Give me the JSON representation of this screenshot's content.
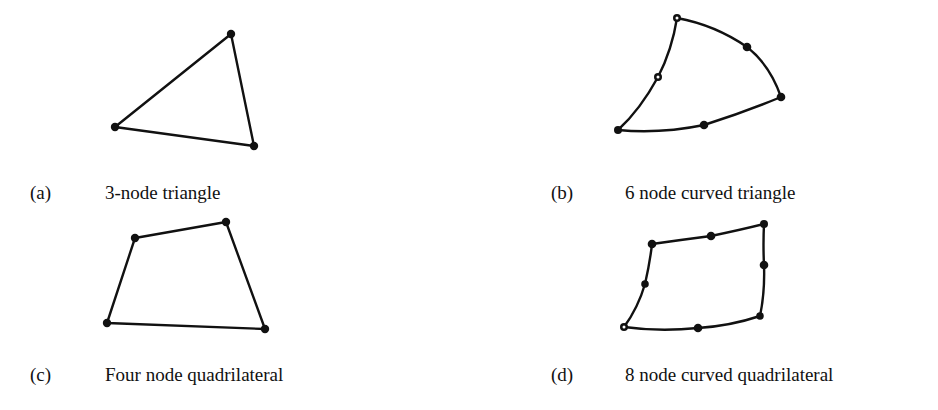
{
  "figure": {
    "panels": [
      {
        "id": "(a)",
        "caption": "3-node triangle",
        "element_type": "triangle",
        "node_count": 3,
        "curved": false,
        "corner_nodes": [
          [
            231,
            34
          ],
          [
            115,
            127
          ],
          [
            254,
            146
          ]
        ],
        "mid_nodes": []
      },
      {
        "id": "(b)",
        "caption": "6 node curved triangle",
        "element_type": "triangle",
        "node_count": 6,
        "curved": true,
        "corner_nodes": [
          [
            677,
            18
          ],
          [
            618,
            130
          ],
          [
            781,
            97
          ]
        ],
        "mid_nodes": [
          [
            658,
            77
          ],
          [
            704,
            125
          ],
          [
            747,
            47
          ]
        ]
      },
      {
        "id": "(c)",
        "caption": "Four node quadrilateral",
        "element_type": "quadrilateral",
        "node_count": 4,
        "curved": false,
        "corner_nodes": [
          [
            135,
            238
          ],
          [
            226,
            222
          ],
          [
            265,
            329
          ],
          [
            107,
            323
          ]
        ],
        "mid_nodes": []
      },
      {
        "id": "(d)",
        "caption": "8 node curved quadrilateral",
        "element_type": "quadrilateral",
        "node_count": 8,
        "curved": true,
        "corner_nodes": [
          [
            652,
            244
          ],
          [
            764,
            224
          ],
          [
            760,
            316
          ],
          [
            624,
            327
          ]
        ],
        "mid_nodes": [
          [
            711,
            236
          ],
          [
            764,
            265
          ],
          [
            698,
            328
          ],
          [
            645,
            284
          ]
        ]
      }
    ]
  }
}
